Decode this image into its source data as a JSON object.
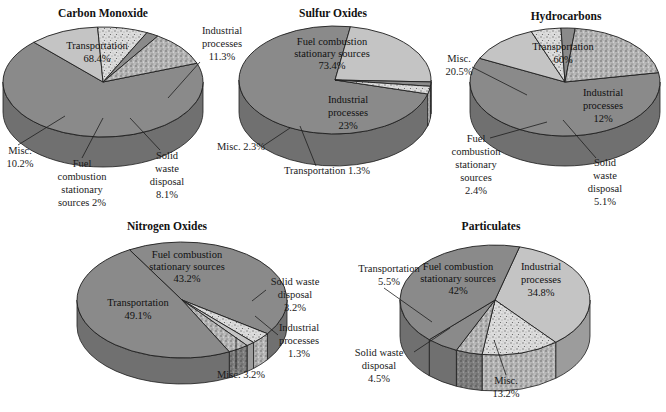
{
  "chart_data": [
    {
      "type": "pie",
      "title": "Carbon Monoxide",
      "categories": [
        "Transportation",
        "Industrial processes",
        "Solid waste disposal",
        "Fuel combustion stationary sources",
        "Misc."
      ],
      "values": [
        68.4,
        11.3,
        8.1,
        2.0,
        10.2
      ],
      "labels": [
        "Transportation 68.4%",
        "Industrial processes 11.3%",
        "Solid waste disposal 8.1%",
        "Fuel combustion stationary sources 2%",
        "Misc. 10.2%"
      ],
      "style": "3d"
    },
    {
      "type": "pie",
      "title": "Sulfur Oxides",
      "categories": [
        "Fuel combustion stationary sources",
        "Industrial processes",
        "Transportation",
        "Misc."
      ],
      "values": [
        73.4,
        23.0,
        1.3,
        2.3
      ],
      "labels": [
        "Fuel combustion stationary sources 73.4%",
        "Industrial processes 23%",
        "Transportation 1.3%",
        "Misc. 2.3%"
      ],
      "style": "3d"
    },
    {
      "type": "pie",
      "title": "Hydrocarbons",
      "categories": [
        "Transportation",
        "Industrial processes",
        "Solid waste disposal",
        "Fuel combustion stationary sources",
        "Misc."
      ],
      "values": [
        60.0,
        12.0,
        5.1,
        2.4,
        20.5
      ],
      "labels": [
        "Transportation 60%",
        "Industrial processes 12%",
        "Solid waste disposal 5.1%",
        "Fuel combustion stationary sources 2.4%",
        "Misc. 20.5%"
      ],
      "style": "3d"
    },
    {
      "type": "pie",
      "title": "Nitrogen Oxides",
      "categories": [
        "Fuel combustion stationary sources",
        "Solid waste disposal",
        "Industrial processes",
        "Misc.",
        "Transportation"
      ],
      "values": [
        43.2,
        3.2,
        1.3,
        3.2,
        49.1
      ],
      "labels": [
        "Fuel combustion stationary sources 43.2%",
        "Solid waste disposal 3.2%",
        "Industrial processes 1.3%",
        "Misc. 3.2%",
        "Transportation 49.1%"
      ],
      "style": "3d"
    },
    {
      "type": "pie",
      "title": "Particulates",
      "categories": [
        "Industrial processes",
        "Misc.",
        "Solid waste disposal",
        "Transportation",
        "Fuel combustion stationary sources"
      ],
      "values": [
        34.8,
        13.2,
        4.5,
        5.5,
        42.0
      ],
      "labels": [
        "Industrial processes 34.8%",
        "Misc. 13.2%",
        "Solid waste disposal 4.5%",
        "Transportation 5.5%",
        "Fuel combustion stationary sources 42%"
      ],
      "style": "3d"
    }
  ],
  "charts": {
    "co": {
      "title": "Carbon Monoxide",
      "transport": {
        "name": "Transportation",
        "pct": "68.4%"
      },
      "industrial": {
        "line1": "Industrial",
        "line2": "processes",
        "pct": "11.3%"
      },
      "misc": {
        "name": "Misc.",
        "pct": "10.2%"
      },
      "fuel": {
        "line1": "Fuel",
        "line2": "combustion",
        "line3": "stationary",
        "line4": "sources 2%"
      },
      "solid": {
        "line1": "Solid",
        "line2": "waste",
        "line3": "disposal",
        "pct": "8.1%"
      }
    },
    "so": {
      "title": "Sulfur Oxides",
      "fuel": {
        "line1": "Fuel combustion",
        "line2": "stationary sources",
        "pct": "73.4%"
      },
      "industrial": {
        "line1": "Industrial",
        "line2": "processes",
        "pct": "23%"
      },
      "misc": "Misc. 2.3%",
      "transport": "Transportation 1.3%"
    },
    "hc": {
      "title": "Hydrocarbons",
      "transport": {
        "name": "Transportation",
        "pct": "60%"
      },
      "misc": {
        "name": "Misc.",
        "pct": "20.5%"
      },
      "industrial": {
        "line1": "Industrial",
        "line2": "processes",
        "pct": "12%"
      },
      "fuel": {
        "line1": "Fuel",
        "line2": "combustion",
        "line3": "stationary",
        "line4": "sources",
        "pct": "2.4%"
      },
      "solid": {
        "line1": "Solid",
        "line2": "waste",
        "line3": "disposal",
        "pct": "5.1%"
      }
    },
    "no": {
      "title": "Nitrogen Oxides",
      "fuel": {
        "line1": "Fuel combustion",
        "line2": "stationary sources",
        "pct": "43.2%"
      },
      "transport": {
        "name": "Transportation",
        "pct": "49.1%"
      },
      "solid": {
        "line1": "Solid waste",
        "line2": "disposal",
        "pct": "3.2%"
      },
      "industrial": {
        "line1": "Industrial",
        "line2": "processes",
        "pct": "1.3%"
      },
      "misc": "Misc. 3.2%"
    },
    "pm": {
      "title": "Particulates",
      "transport": {
        "name": "Transportation",
        "pct": "5.5%"
      },
      "fuel": {
        "line1": "Fuel combustion",
        "line2": "stationary sources",
        "pct": "42%"
      },
      "industrial": {
        "line1": "Industrial",
        "line2": "processes",
        "pct": "34.8%"
      },
      "solid": {
        "line1": "Solid waste",
        "line2": "disposal",
        "pct": "4.5%"
      },
      "misc": {
        "name": "Misc.",
        "pct": "13.2%"
      }
    }
  },
  "colors": {
    "dark_top": "#8a8a8a",
    "dark_side": "#707070",
    "light_top": "#c4c4c4",
    "light_side": "#9c9c9c",
    "speckle_light": "#d8d8d8",
    "speckle_dark": "#8e8e8e",
    "stroke": "#1e1e1e"
  }
}
